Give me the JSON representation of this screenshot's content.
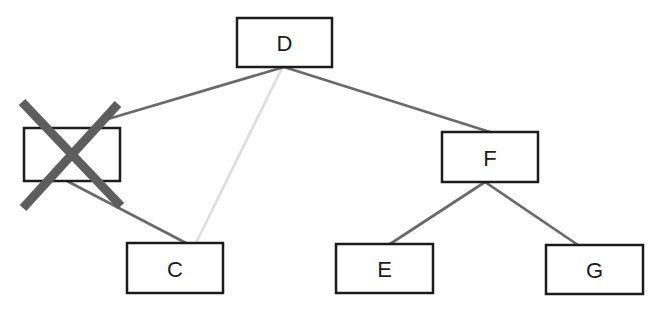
{
  "diagram": {
    "type": "tree",
    "nodes": [
      {
        "id": "D",
        "label": "D",
        "x": 237,
        "y": 18,
        "w": 95,
        "h": 49,
        "deleted": false
      },
      {
        "id": "deleted",
        "label": "",
        "x": 24,
        "y": 128,
        "w": 96,
        "h": 53,
        "deleted": true
      },
      {
        "id": "C",
        "label": "C",
        "x": 127,
        "y": 243,
        "w": 96,
        "h": 50,
        "deleted": false
      },
      {
        "id": "F",
        "label": "F",
        "x": 442,
        "y": 132,
        "w": 96,
        "h": 50,
        "deleted": false
      },
      {
        "id": "E",
        "label": "E",
        "x": 336,
        "y": 244,
        "w": 97,
        "h": 49,
        "deleted": false
      },
      {
        "id": "G",
        "label": "G",
        "x": 546,
        "y": 245,
        "w": 97,
        "h": 49,
        "deleted": false
      }
    ],
    "edges": [
      {
        "from": "D",
        "to": "C",
        "x1": 282,
        "y1": 68,
        "x2": 196,
        "y2": 243,
        "style": "faint"
      },
      {
        "from": "D",
        "to": "deleted",
        "x1": 284,
        "y1": 67,
        "x2": 108,
        "y2": 119,
        "style": "solid"
      },
      {
        "from": "D",
        "to": "F",
        "x1": 284,
        "y1": 67,
        "x2": 490,
        "y2": 132,
        "style": "solid"
      },
      {
        "from": "deleted",
        "to": "C",
        "x1": 67,
        "y1": 181,
        "x2": 186,
        "y2": 243,
        "style": "solid"
      },
      {
        "from": "F",
        "to": "E",
        "x1": 485,
        "y1": 182,
        "x2": 390,
        "y2": 244,
        "style": "solid"
      },
      {
        "from": "F",
        "to": "G",
        "x1": 485,
        "y1": 182,
        "x2": 578,
        "y2": 245,
        "style": "solid"
      }
    ],
    "cross_mark": {
      "over_node": "deleted",
      "strokes": [
        {
          "x1": 22,
          "y1": 102,
          "x2": 121,
          "y2": 206
        },
        {
          "x1": 118,
          "y1": 104,
          "x2": 23,
          "y2": 208
        }
      ]
    }
  },
  "colors": {
    "background": "#ffffff",
    "node_border": "#1c1c1c",
    "node_fill": "#ffffff",
    "edge_solid": "#6a6a6a",
    "edge_faint": "#dedede",
    "cross": "#5e5e5e",
    "label_text": "#1c1c1c"
  },
  "canvas": {
    "width": 665,
    "height": 309
  }
}
